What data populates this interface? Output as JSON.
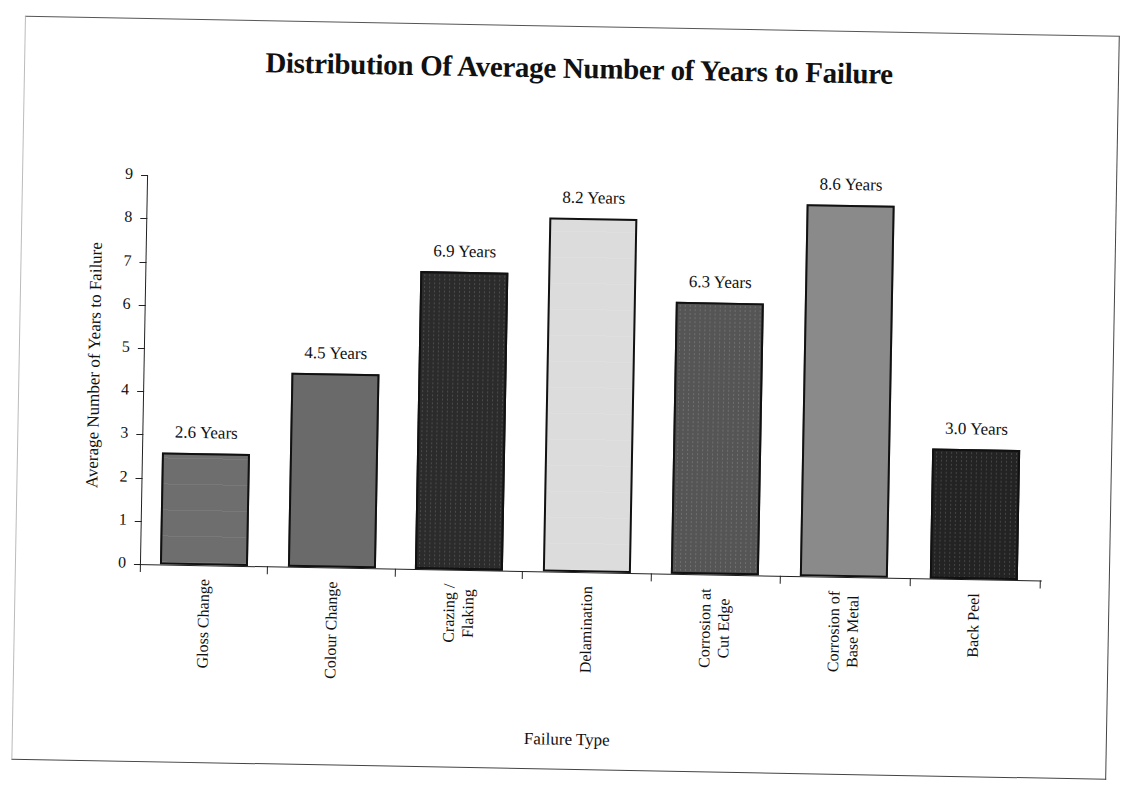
{
  "chart_data": {
    "type": "bar",
    "title": "Distribution Of Average Number of Years to Failure",
    "xlabel": "Failure Type",
    "ylabel": "Average Number of Years to Failure",
    "ylim": [
      0,
      9
    ],
    "yticks": [
      "0",
      "1",
      "2",
      "3",
      "4",
      "5",
      "6",
      "7",
      "8",
      "9"
    ],
    "grid": false,
    "legend": null,
    "categories": [
      "Gloss Change",
      "Colour Change",
      "Crazing / Flaking",
      "Delamination",
      "Corrosion at Cut Edge",
      "Corrosion of Base Metal",
      "Back Peel"
    ],
    "values": [
      2.6,
      4.5,
      6.9,
      8.2,
      6.3,
      8.6,
      3.0
    ],
    "data_labels": [
      "2.6 Years",
      "4.5 Years",
      "6.9 Years",
      "8.2 Years",
      "6.3 Years",
      "8.6 Years",
      "3.0 Years"
    ],
    "bar_colors": [
      "#6e6e6e",
      "#6a6a6a",
      "#2b2b2b",
      "#dcdcdc",
      "#555555",
      "#8a8a8a",
      "#232323"
    ]
  },
  "category_lines": [
    [
      "Gloss Change"
    ],
    [
      "Colour Change"
    ],
    [
      "Crazing /",
      "Flaking"
    ],
    [
      "Delamination"
    ],
    [
      "Corrosion at",
      "Cut Edge"
    ],
    [
      "Corrosion of",
      "Base Metal"
    ],
    [
      "Back Peel"
    ]
  ]
}
